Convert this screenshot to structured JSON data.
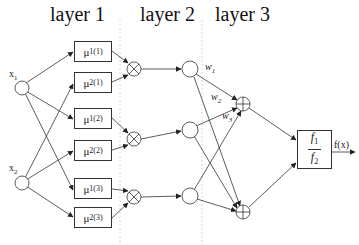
{
  "diagram": {
    "layers": [
      {
        "label": "layer 1",
        "x": 50
      },
      {
        "label": "layer 2",
        "x": 140
      },
      {
        "label": "layer 3",
        "x": 215
      }
    ],
    "inputs": [
      {
        "id": "x1",
        "label": "x",
        "sub": "1",
        "cx": 22,
        "cy": 88
      },
      {
        "id": "x2",
        "label": "x",
        "sub": "2",
        "cx": 22,
        "cy": 183
      }
    ],
    "membership_functions": [
      {
        "base": "μ",
        "sub": "1",
        "sup": "(1)",
        "x": 74,
        "y": 41
      },
      {
        "base": "μ",
        "sub": "2",
        "sup": "(1)",
        "x": 74,
        "y": 72
      },
      {
        "base": "μ",
        "sub": "1",
        "sup": "(2)",
        "x": 74,
        "y": 108
      },
      {
        "base": "μ",
        "sub": "2",
        "sup": "(2)",
        "x": 74,
        "y": 140
      },
      {
        "base": "μ",
        "sub": "1",
        "sup": "(3)",
        "x": 74,
        "y": 178
      },
      {
        "base": "μ",
        "sub": "2",
        "sup": "(3)",
        "x": 74,
        "y": 207
      }
    ],
    "product_nodes": [
      {
        "symbol": "⊗",
        "cx": 134,
        "cy": 69
      },
      {
        "symbol": "⊗",
        "cx": 134,
        "cy": 139
      },
      {
        "symbol": "⊗",
        "cx": 134,
        "cy": 197
      }
    ],
    "normalization_nodes": [
      {
        "cx": 190,
        "cy": 69
      },
      {
        "cx": 190,
        "cy": 130
      },
      {
        "cx": 190,
        "cy": 196
      }
    ],
    "weights": [
      {
        "label": "w",
        "sub": "1",
        "x": 207,
        "y": 67
      },
      {
        "label": "w",
        "sub": "2",
        "x": 212,
        "y": 98
      },
      {
        "label": "w",
        "sub": "3",
        "x": 222,
        "y": 113
      }
    ],
    "sum_nodes": [
      {
        "symbol": "⊕",
        "cx": 243,
        "cy": 104
      },
      {
        "symbol": "⊕",
        "cx": 243,
        "cy": 212
      }
    ],
    "output_box": {
      "numerator": "f",
      "numerator_sub": "1",
      "denominator": "f",
      "denominator_sub": "2"
    },
    "output_label": "f(x)",
    "line_color": "#333333",
    "divider_color": "#d8d8d8"
  }
}
